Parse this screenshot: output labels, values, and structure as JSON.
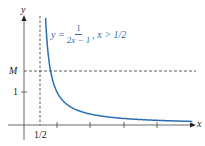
{
  "chart_data": {
    "type": "line",
    "title": "",
    "xlabel": "x",
    "ylabel": "y",
    "series": [
      {
        "name": "y = 1/(2x − 1), x > 1/2",
        "function": "1/(2x-1)",
        "domain": [
          0.52,
          5.1
        ],
        "color": "#2a6db0"
      }
    ],
    "annotations": {
      "formula": {
        "lhs": "y =",
        "numerator": "1",
        "denominator": "2x − 1",
        "condition": ", x > 1/2"
      },
      "horizontal_dashed_line": {
        "label": "M",
        "y": 1.64
      },
      "vertical_dashed_line": {
        "label": "1/2",
        "x": 0.5
      }
    },
    "x_ticks": [
      {
        "value": 0.5,
        "label": "1/2"
      },
      {
        "value": 1,
        "label": ""
      },
      {
        "value": 2,
        "label": ""
      },
      {
        "value": 3,
        "label": ""
      },
      {
        "value": 4,
        "label": ""
      }
    ],
    "y_ticks": [
      {
        "value": 1,
        "label": "1"
      }
    ],
    "xlim": [
      -0.3,
      5.2
    ],
    "ylim": [
      -0.5,
      3.3
    ],
    "grid": false,
    "legend": "none"
  },
  "labels": {
    "y_axis": "y",
    "x_axis": "x",
    "M": "M",
    "one": "1",
    "half": "1/2",
    "formula_lhs": "y =",
    "formula_num": "1",
    "formula_den": "2x − 1",
    "formula_cond": ", x > 1/2"
  }
}
